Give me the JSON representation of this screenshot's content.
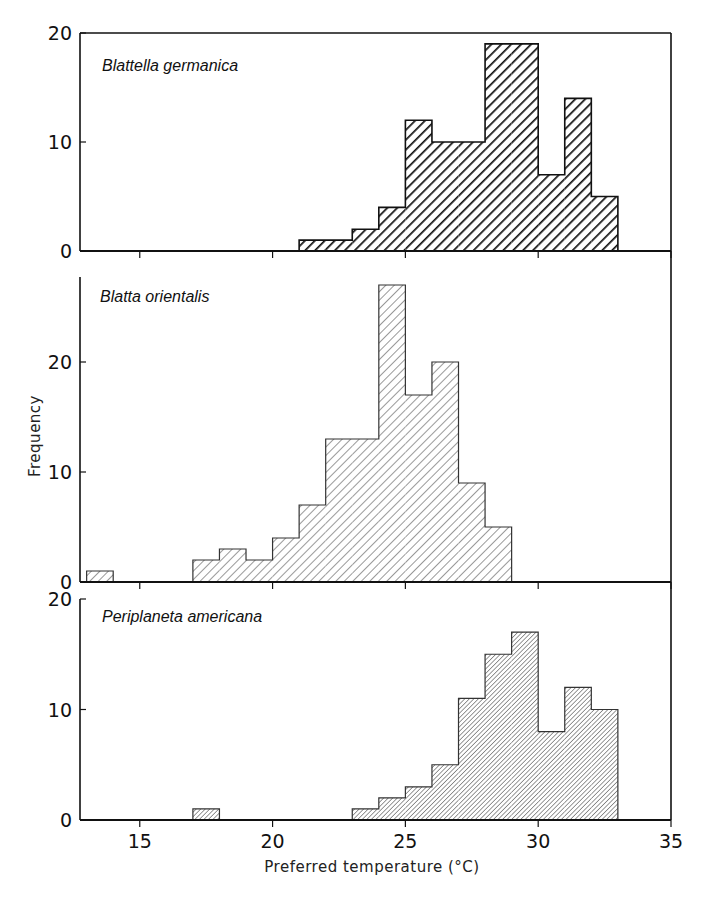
{
  "chart_data": {
    "type": "bar",
    "subtype": "stacked-panel histogram",
    "title": "",
    "xlabel": "Preferred temperature (°C)",
    "ylabel": "Frequency",
    "xlim": [
      13,
      35
    ],
    "x_ticks": [
      15,
      20,
      25,
      30,
      35
    ],
    "bin_width": 1,
    "grid": false,
    "legend": "none (panel labels)",
    "panels": [
      {
        "name": "Blattella germanica",
        "hatch": "dense-bold",
        "ylim": [
          0,
          20
        ],
        "y_ticks": [
          0,
          10,
          20
        ],
        "bins": [
          {
            "x0": 21,
            "x1": 22,
            "count": 1
          },
          {
            "x0": 22,
            "x1": 23,
            "count": 1
          },
          {
            "x0": 23,
            "x1": 24,
            "count": 2
          },
          {
            "x0": 24,
            "x1": 25,
            "count": 4
          },
          {
            "x0": 25,
            "x1": 26,
            "count": 12
          },
          {
            "x0": 26,
            "x1": 27,
            "count": 10
          },
          {
            "x0": 27,
            "x1": 28,
            "count": 10
          },
          {
            "x0": 28,
            "x1": 29,
            "count": 19
          },
          {
            "x0": 29,
            "x1": 30,
            "count": 19
          },
          {
            "x0": 30,
            "x1": 31,
            "count": 7
          },
          {
            "x0": 31,
            "x1": 32,
            "count": 14
          },
          {
            "x0": 32,
            "x1": 33,
            "count": 5
          }
        ]
      },
      {
        "name": "Blatta orientalis",
        "hatch": "light-wide",
        "ylim": [
          0,
          28
        ],
        "y_ticks": [
          0,
          10,
          20
        ],
        "bins": [
          {
            "x0": 13,
            "x1": 14,
            "count": 1
          },
          {
            "x0": 17,
            "x1": 18,
            "count": 2
          },
          {
            "x0": 18,
            "x1": 19,
            "count": 3
          },
          {
            "x0": 19,
            "x1": 20,
            "count": 2
          },
          {
            "x0": 20,
            "x1": 21,
            "count": 4
          },
          {
            "x0": 21,
            "x1": 22,
            "count": 7
          },
          {
            "x0": 22,
            "x1": 23,
            "count": 13
          },
          {
            "x0": 23,
            "x1": 24,
            "count": 13
          },
          {
            "x0": 24,
            "x1": 25,
            "count": 27
          },
          {
            "x0": 25,
            "x1": 26,
            "count": 17
          },
          {
            "x0": 26,
            "x1": 27,
            "count": 20
          },
          {
            "x0": 27,
            "x1": 28,
            "count": 9
          },
          {
            "x0": 28,
            "x1": 29,
            "count": 5
          }
        ]
      },
      {
        "name": "Periplaneta americana",
        "hatch": "fine-dense",
        "ylim": [
          0,
          20
        ],
        "y_ticks": [
          0,
          10,
          20
        ],
        "bins": [
          {
            "x0": 17,
            "x1": 18,
            "count": 1
          },
          {
            "x0": 23,
            "x1": 24,
            "count": 1
          },
          {
            "x0": 24,
            "x1": 25,
            "count": 2
          },
          {
            "x0": 25,
            "x1": 26,
            "count": 3
          },
          {
            "x0": 26,
            "x1": 27,
            "count": 5
          },
          {
            "x0": 27,
            "x1": 28,
            "count": 11
          },
          {
            "x0": 28,
            "x1": 29,
            "count": 15
          },
          {
            "x0": 29,
            "x1": 30,
            "count": 17
          },
          {
            "x0": 30,
            "x1": 31,
            "count": 8
          },
          {
            "x0": 31,
            "x1": 32,
            "count": 12
          },
          {
            "x0": 32,
            "x1": 33,
            "count": 10
          }
        ]
      }
    ]
  },
  "labels": {
    "panel_1": "Blattella  germanica",
    "panel_2": "Blatta  orientalis",
    "panel_3": "Periplaneta  americana",
    "y_axis_title": "Frequency",
    "x_axis_title": "Preferred  temperature  (°C)"
  }
}
